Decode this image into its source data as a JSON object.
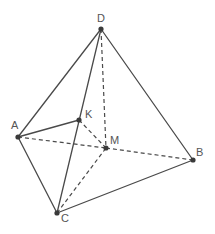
{
  "diagram": {
    "type": "tetrahedron",
    "points": {
      "D": {
        "label": "D",
        "x": 101,
        "y": 29,
        "lx": 97,
        "ly": 22
      },
      "A": {
        "label": "A",
        "x": 18,
        "y": 137,
        "lx": 11,
        "ly": 129
      },
      "K": {
        "label": "K",
        "x": 79,
        "y": 120,
        "lx": 85,
        "ly": 118
      },
      "M": {
        "label": "M",
        "x": 106,
        "y": 148,
        "lx": 110,
        "ly": 144
      },
      "B": {
        "label": "B",
        "x": 193,
        "y": 160,
        "lx": 196,
        "ly": 156
      },
      "C": {
        "label": "C",
        "x": 57,
        "y": 213,
        "lx": 61,
        "ly": 222
      }
    },
    "solid_edges": [
      [
        "D",
        "A"
      ],
      [
        "D",
        "B"
      ],
      [
        "D",
        "C"
      ],
      [
        "A",
        "C"
      ],
      [
        "C",
        "B"
      ],
      [
        "A",
        "K"
      ]
    ],
    "dashed_edges": [
      [
        "D",
        "M"
      ],
      [
        "A",
        "M"
      ],
      [
        "M",
        "B"
      ],
      [
        "C",
        "M"
      ],
      [
        "K",
        "M"
      ]
    ],
    "colors": {
      "line": "#4a4a4a",
      "point": "#3a3a3a",
      "label": "#555555"
    }
  }
}
